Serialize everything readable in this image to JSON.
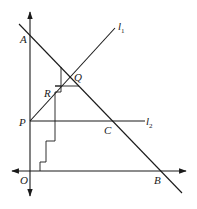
{
  "diagram": {
    "title": "",
    "labels": {
      "A": "A",
      "Q": "Q",
      "R": "R",
      "P": "P",
      "C": "C",
      "O": "O",
      "B": "B",
      "l1": "l",
      "l1_sub": "1",
      "l2": "l",
      "l2_sub": "2"
    },
    "points": {
      "O": [
        30,
        171
      ],
      "A": [
        30,
        33
      ],
      "B": [
        160,
        171
      ],
      "P": [
        30,
        121
      ],
      "C": [
        112,
        121
      ],
      "Q": [
        70,
        77
      ],
      "R": [
        55,
        93
      ]
    },
    "lines": [
      {
        "name": "y-axis",
        "from": [
          30,
          12
        ],
        "to": [
          30,
          196
        ],
        "arrows": "both"
      },
      {
        "name": "x-axis",
        "from": [
          12,
          171
        ],
        "to": [
          186,
          171
        ],
        "arrows": "both"
      },
      {
        "name": "line-AB",
        "from": [
          19,
          24
        ],
        "to": [
          182,
          193
        ]
      },
      {
        "name": "line-l1",
        "from": [
          30,
          121
        ],
        "to": [
          115,
          28
        ]
      },
      {
        "name": "line-l2",
        "from": [
          30,
          121
        ],
        "to": [
          145,
          121
        ]
      }
    ],
    "colors": {
      "stroke": "#1a1a1a",
      "background": "#ffffff"
    }
  }
}
